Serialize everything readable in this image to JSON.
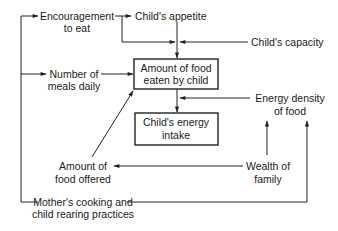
{
  "diagram": {
    "type": "flow-diagram",
    "nodes": {
      "encouragement": {
        "lines": [
          "Encouragement",
          "to eat"
        ]
      },
      "appetite": {
        "lines": [
          "Child's appetite"
        ]
      },
      "capacity": {
        "lines": [
          "Child's capacity"
        ]
      },
      "meals": {
        "lines": [
          "Number of",
          "meals daily"
        ]
      },
      "amount_eaten": {
        "lines": [
          "Amount of food",
          "eaten by child"
        ],
        "boxed": true
      },
      "energy_density": {
        "lines": [
          "Energy density",
          "of food"
        ]
      },
      "energy_intake": {
        "lines": [
          "Child's energy",
          "intake"
        ],
        "boxed": true
      },
      "food_offered": {
        "lines": [
          "Amount of",
          "food offered"
        ]
      },
      "wealth": {
        "lines": [
          "Wealth of",
          "family"
        ]
      },
      "mother": {
        "lines": [
          "Mother's cooking and",
          "child rearing practices"
        ]
      }
    },
    "edges": [
      {
        "from": "mother",
        "to": "encouragement"
      },
      {
        "from": "mother",
        "to": "meals"
      },
      {
        "from": "mother",
        "to": "energy_density"
      },
      {
        "from": "encouragement",
        "to": "appetite"
      },
      {
        "from": "encouragement",
        "to": "amount_eaten"
      },
      {
        "from": "appetite",
        "to": "amount_eaten"
      },
      {
        "from": "capacity",
        "to": "amount_eaten"
      },
      {
        "from": "meals",
        "to": "amount_eaten"
      },
      {
        "from": "food_offered",
        "to": "amount_eaten"
      },
      {
        "from": "amount_eaten",
        "to": "energy_intake"
      },
      {
        "from": "energy_density",
        "to": "energy_intake"
      },
      {
        "from": "wealth",
        "to": "food_offered"
      },
      {
        "from": "wealth",
        "to": "energy_density"
      }
    ]
  }
}
